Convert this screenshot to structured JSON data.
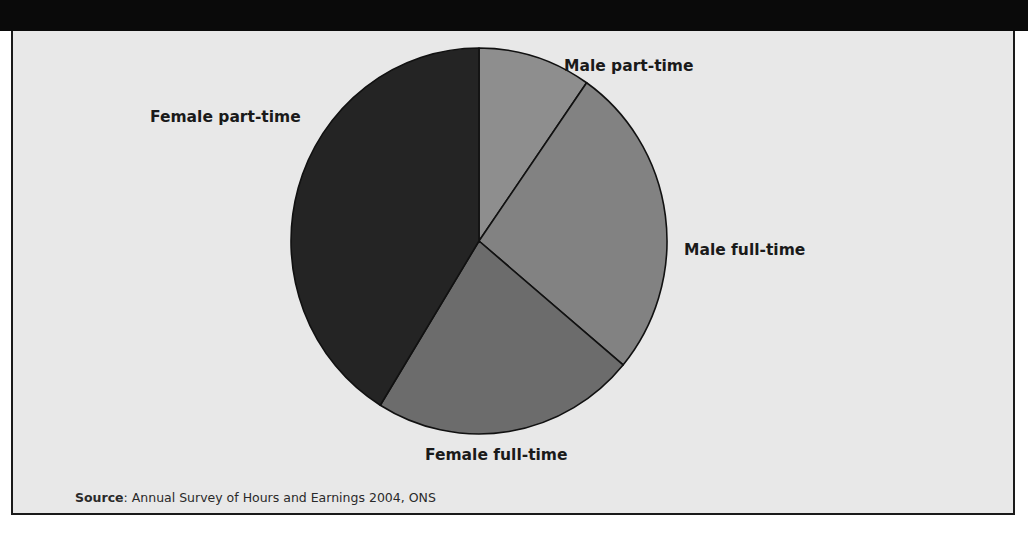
{
  "chart_data": {
    "type": "pie",
    "title": "",
    "start_angle_deg": 0,
    "direction": "clockwise",
    "slices": [
      {
        "label": "Male part-time",
        "value": 9.7,
        "color": "#8e8e8e"
      },
      {
        "label": "Male full-time",
        "value": 26.4,
        "color": "#828282"
      },
      {
        "label": "Female full-time",
        "value": 22.7,
        "color": "#6c6c6c"
      },
      {
        "label": "Female part-time",
        "value": 41.2,
        "color": "#242424"
      }
    ],
    "value_unit": "percent (estimated from slice angles)",
    "labels_outside": true,
    "legend": "none"
  },
  "source": {
    "prefix": "Source",
    "separator": ":",
    "text": " Annual Survey of Hours and Earnings 2004, ONS"
  },
  "colors": {
    "background": "#e8e8e8",
    "title_bar": "#0a0a0a",
    "slice_outline": "#111111"
  }
}
